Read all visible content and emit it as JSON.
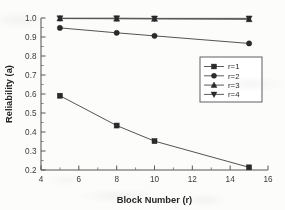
{
  "chart_data": {
    "type": "line",
    "title": "",
    "xlabel": "Block Number (r)",
    "ylabel": "Reliability  (a)",
    "xlim": [
      4,
      16
    ],
    "ylim": [
      0.2,
      1.0
    ],
    "xticks": [
      4,
      6,
      8,
      10,
      12,
      14,
      16
    ],
    "yticks": [
      0.2,
      0.3,
      0.4,
      0.5,
      0.6,
      0.7,
      0.8,
      0.9,
      1.0
    ],
    "xtick_labels": [
      "4",
      "6",
      "8",
      "10",
      "12",
      "14",
      "16"
    ],
    "ytick_labels": [
      "0.2",
      "0.3",
      "0.4",
      "0.5",
      "0.6",
      "0.7",
      "0.8",
      "0.9",
      "1.0"
    ],
    "grid": false,
    "legend_position": "center-right",
    "x": [
      5,
      8,
      10,
      15
    ],
    "series": [
      {
        "name": "r=1",
        "marker": "square",
        "values": [
          0.591,
          0.434,
          0.352,
          0.214
        ]
      },
      {
        "name": "r=2",
        "marker": "circle",
        "values": [
          0.948,
          0.922,
          0.906,
          0.866
        ]
      },
      {
        "name": "r=3",
        "marker": "triangle-up",
        "values": [
          0.997,
          0.996,
          0.995,
          0.993
        ]
      },
      {
        "name": "r=4",
        "marker": "triangle-down",
        "values": [
          0.999,
          0.999,
          0.998,
          0.998
        ]
      }
    ]
  },
  "axes": {
    "x_title": "Block Number (r)",
    "y_title": "Reliability  (a)"
  },
  "legend": {
    "entries": [
      {
        "label": "r=1"
      },
      {
        "label": "r=2"
      },
      {
        "label": "r=3"
      },
      {
        "label": "r=4"
      }
    ]
  },
  "colors": {
    "line": "#4a4a4a",
    "marker": "#2b2b2b",
    "axis": "#575757",
    "text": "#2a2a2a",
    "background": "#fcfcfb"
  }
}
